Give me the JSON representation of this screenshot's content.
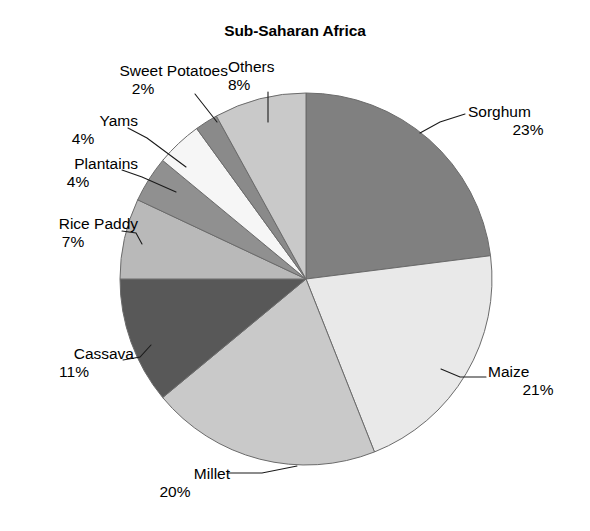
{
  "chart_data": {
    "type": "pie",
    "title": "Sub-Saharan Africa",
    "xlabel": "",
    "ylabel": "",
    "legend": "none",
    "grid": false,
    "start_angle_deg": 0,
    "direction": "clockwise",
    "unit": "%",
    "categories": [
      "Sorghum",
      "Maize",
      "Millet",
      "Cassava",
      "Rice Paddy",
      "Plantains",
      "Yams",
      "Sweet Potatoes",
      "Others"
    ],
    "values": [
      23,
      21,
      20,
      11,
      7,
      4,
      4,
      2,
      8
    ],
    "total": 100,
    "slices": [
      {
        "label": "Sorghum",
        "value": 23,
        "pct_text": "23%",
        "color": "#808080"
      },
      {
        "label": "Maize",
        "value": 21,
        "pct_text": "21%",
        "color": "#e9e9e9"
      },
      {
        "label": "Millet",
        "value": 20,
        "pct_text": "20%",
        "color": "#c9c9c9"
      },
      {
        "label": "Cassava",
        "value": 11,
        "pct_text": "11%",
        "color": "#585858"
      },
      {
        "label": "Rice Paddy",
        "value": 7,
        "pct_text": "7%",
        "color": "#b9b9b9"
      },
      {
        "label": "Plantains",
        "value": 4,
        "pct_text": "4%",
        "color": "#909090"
      },
      {
        "label": "Yams",
        "value": 4,
        "pct_text": "4%",
        "color": "#f6f6f6"
      },
      {
        "label": "Sweet Potatoes",
        "value": 2,
        "pct_text": "2%",
        "color": "#8a8a8a"
      },
      {
        "label": "Others",
        "value": 8,
        "pct_text": "8%",
        "color": "#c9c9c9"
      }
    ]
  },
  "colors": {
    "background": "#ffffff",
    "text": "#000000",
    "outline": "#6b6b6b",
    "leader_line": "#1a1a1a"
  }
}
